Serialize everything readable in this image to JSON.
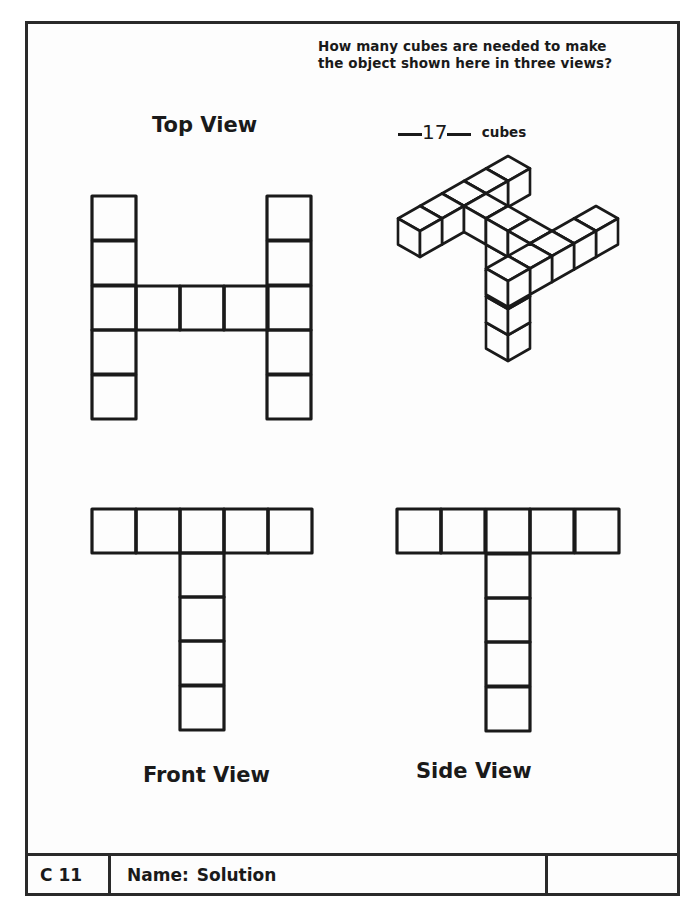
{
  "question": {
    "line1": "How many cubes are needed to make",
    "line2": "the object shown here in three views?"
  },
  "answer": {
    "value": "17",
    "unit": "cubes"
  },
  "views": {
    "top": {
      "label": "Top View",
      "cell": 44,
      "cells": [
        [
          92,
          196
        ],
        [
          92,
          241
        ],
        [
          92,
          286
        ],
        [
          92,
          330
        ],
        [
          92,
          375
        ],
        [
          136,
          286
        ],
        [
          180,
          286
        ],
        [
          224,
          286
        ],
        [
          267,
          196
        ],
        [
          267,
          241
        ],
        [
          267,
          286
        ],
        [
          267,
          330
        ],
        [
          267,
          375
        ]
      ]
    },
    "front": {
      "label": "Front View",
      "cell": 44,
      "cells": [
        [
          92,
          509
        ],
        [
          136,
          509
        ],
        [
          180,
          509
        ],
        [
          224,
          509
        ],
        [
          268,
          509
        ],
        [
          180,
          553
        ],
        [
          180,
          597
        ],
        [
          180,
          641
        ],
        [
          180,
          686
        ]
      ]
    },
    "side": {
      "label": "Side View",
      "cell": 44,
      "cells": [
        [
          397,
          509
        ],
        [
          441,
          509
        ],
        [
          486,
          509
        ],
        [
          530,
          509
        ],
        [
          575,
          509
        ],
        [
          486,
          554
        ],
        [
          486,
          598
        ],
        [
          486,
          642
        ],
        [
          486,
          687
        ]
      ]
    },
    "isometric": {
      "origin": [
        508,
        208
      ],
      "dx": 22,
      "dy": 12.5,
      "dz": 26,
      "cubes": [
        [
          0,
          0,
          0
        ],
        [
          0,
          1,
          0
        ],
        [
          0,
          2,
          0
        ],
        [
          0,
          3,
          0
        ],
        [
          0,
          4,
          0
        ],
        [
          1,
          2,
          0
        ],
        [
          2,
          2,
          0
        ],
        [
          3,
          2,
          0
        ],
        [
          4,
          0,
          0
        ],
        [
          4,
          1,
          0
        ],
        [
          4,
          2,
          0
        ],
        [
          4,
          3,
          0
        ],
        [
          4,
          4,
          0
        ],
        [
          2,
          2,
          -1
        ],
        [
          2,
          2,
          -2
        ],
        [
          2,
          2,
          -3
        ],
        [
          2,
          2,
          -4
        ]
      ]
    }
  },
  "footer": {
    "code": "C 11",
    "name_label": "Name:",
    "name_value": "Solution",
    "extra": ""
  },
  "colors": {
    "ink": "#1a1a1a",
    "paper": "#fdfdfd"
  }
}
